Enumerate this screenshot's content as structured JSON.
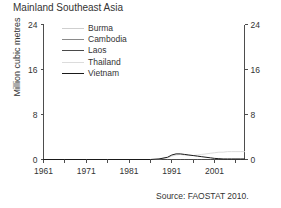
{
  "chart_data": {
    "type": "line",
    "title": "Mainland Southeast Asia",
    "xlabel": "",
    "ylabel": "Million cubic metres",
    "ylabel_right": "Million cubic metres",
    "source": "Source: FAOSTAT 2010.",
    "xlim": [
      1961,
      2008
    ],
    "ylim": [
      0,
      24
    ],
    "yticks": [
      0,
      8,
      16,
      24
    ],
    "ytick_labels": [
      "0",
      "8",
      "16",
      "24"
    ],
    "ytick_labels_right": [
      "0",
      "8",
      "16",
      "24"
    ],
    "xticks": [
      1961,
      1966,
      1971,
      1976,
      1981,
      1986,
      1991,
      1996,
      2001,
      2006
    ],
    "xtick_labels_shown": [
      "1961",
      "1971",
      "1981",
      "1991",
      "2001"
    ],
    "xtick_labels_shown_values": [
      1961,
      1971,
      1981,
      1991,
      2001
    ],
    "grid": false,
    "legend_position": "upper-left-inside",
    "x": [
      1961,
      1966,
      1971,
      1976,
      1981,
      1986,
      1988,
      1990,
      1991,
      1992,
      1993,
      1994,
      1995,
      1996,
      1997,
      1998,
      1999,
      2000,
      2001,
      2002,
      2003,
      2004,
      2005,
      2006,
      2007,
      2008
    ],
    "series": [
      {
        "name": "Burma",
        "color": "#cfcfcf",
        "values": [
          0,
          0,
          0,
          0,
          0,
          0,
          0,
          0,
          0,
          0,
          0,
          0,
          0,
          0,
          0,
          0,
          0,
          0,
          0,
          0,
          0,
          0,
          0,
          0,
          0,
          0
        ]
      },
      {
        "name": "Cambodia",
        "color": "#8a8a8a",
        "values": [
          0,
          0,
          0,
          0,
          0,
          0,
          0,
          0,
          0,
          0,
          0,
          0,
          0,
          0,
          0,
          0,
          0,
          0,
          0,
          0,
          0,
          0,
          0,
          0,
          0,
          0
        ]
      },
      {
        "name": "Laos",
        "color": "#4a4a4a",
        "values": [
          0,
          0,
          0,
          0,
          0,
          0,
          0,
          0,
          0,
          0,
          0,
          0,
          0,
          0,
          0,
          0,
          0,
          0,
          0,
          0,
          0,
          0,
          0,
          0,
          0,
          0
        ]
      },
      {
        "name": "Thailand",
        "color": "#dcdcdc",
        "values": [
          0,
          0,
          0,
          0,
          0,
          0,
          0.1,
          0.3,
          0.6,
          0.8,
          0.9,
          0.8,
          0.7,
          0.7,
          0.8,
          0.9,
          1.0,
          1.1,
          1.2,
          1.3,
          1.3,
          1.4,
          1.4,
          1.4,
          1.4,
          1.4
        ]
      },
      {
        "name": "Vietnam",
        "color": "#1a1a1a",
        "values": [
          0,
          0,
          0,
          0,
          0,
          0,
          0.1,
          0.4,
          0.8,
          1.0,
          1.0,
          0.9,
          0.8,
          0.7,
          0.6,
          0.5,
          0.4,
          0.3,
          0.2,
          0.15,
          0.1,
          0.1,
          0.1,
          0.1,
          0.1,
          0.1
        ]
      }
    ]
  }
}
